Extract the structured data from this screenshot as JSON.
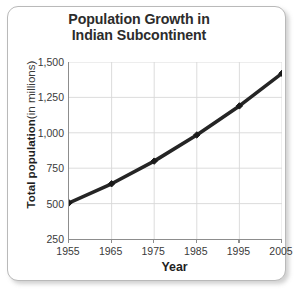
{
  "figure": {
    "title_line_1": "Population Growth in",
    "title_line_2": "Indian Subcontinent",
    "y_axis_title_bold": "Total population",
    "y_axis_title_regular": "(in millions)",
    "x_axis_title": "Year",
    "line_color": "#1a1a1a",
    "grid_color": "#d8d8d8",
    "axis_color": "#8d8d8d",
    "frame_color": "#b9b9b9",
    "text_color": "#2c2c2c"
  },
  "chart_data": {
    "type": "line",
    "title": "Population Growth in Indian Subcontinent",
    "xlabel": "Year",
    "ylabel": "Total population (in millions)",
    "categories": [
      "1955",
      "1965",
      "1975",
      "1985",
      "1995",
      "2005"
    ],
    "x": [
      1955,
      1965,
      1975,
      1985,
      1995,
      2005
    ],
    "values": [
      505,
      640,
      800,
      985,
      1190,
      1420
    ],
    "series": [
      {
        "name": "Total population",
        "values": [
          505,
          640,
          800,
          985,
          1190,
          1420
        ]
      }
    ],
    "xlim": [
      1955,
      2005
    ],
    "ylim": [
      250,
      1500
    ],
    "ytick_labels": [
      "1,500",
      "1,250",
      "1,000",
      "750",
      "500",
      "250"
    ],
    "ytick_values": [
      1500,
      1250,
      1000,
      750,
      500,
      250
    ],
    "xtick_labels": [
      "1955",
      "1965",
      "1975",
      "1985",
      "1995",
      "2005"
    ],
    "grid": true,
    "legend": false,
    "legend_position": "none",
    "marker": "diamond",
    "units": "millions"
  }
}
